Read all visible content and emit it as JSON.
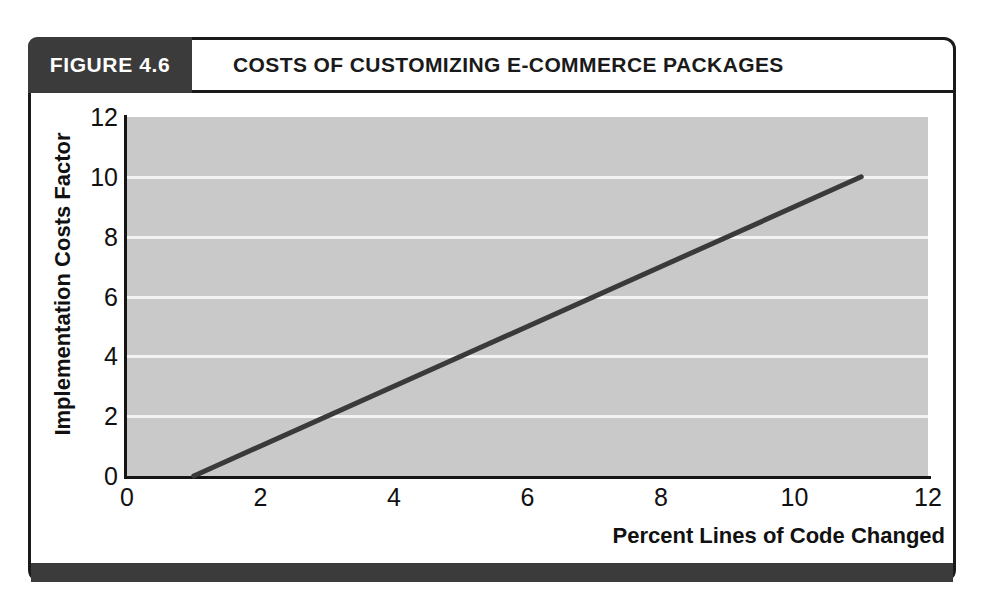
{
  "figure": {
    "number_label": "FIGURE 4.6",
    "title": "COSTS OF CUSTOMIZING E-COMMERCE PACKAGES",
    "header_bg": "#3b3b3b",
    "frame_color": "#1a1a1a"
  },
  "chart_data": {
    "type": "line",
    "title": "COSTS OF CUSTOMIZING E-COMMERCE PACKAGES",
    "subtitle": "",
    "xlabel": "Percent Lines of Code Changed",
    "ylabel": "Implementation Costs Factor",
    "xlim": [
      0,
      12
    ],
    "ylim": [
      0,
      12
    ],
    "xticks": [
      "0",
      "2",
      "4",
      "6",
      "8",
      "10",
      "12"
    ],
    "yticks": [
      "0",
      "2",
      "4",
      "6",
      "8",
      "10",
      "12"
    ],
    "xtick_values": [
      0,
      2,
      4,
      6,
      8,
      10,
      12
    ],
    "ytick_values": [
      0,
      2,
      4,
      6,
      8,
      10,
      12
    ],
    "grid": true,
    "grid_axis": "y",
    "gridline_values": [
      2,
      4,
      6,
      8,
      10
    ],
    "grid_color": "#f2f2f2",
    "plot_bg": "#c9c9c9",
    "legend": null,
    "legend_position": "none",
    "series": [
      {
        "name": "Implementation cost",
        "color": "#3a3a3a",
        "line_width": 5,
        "x": [
          1,
          11
        ],
        "y": [
          0,
          10
        ],
        "points": [
          [
            1,
            0
          ],
          [
            11,
            10
          ]
        ]
      }
    ],
    "annotations": []
  }
}
